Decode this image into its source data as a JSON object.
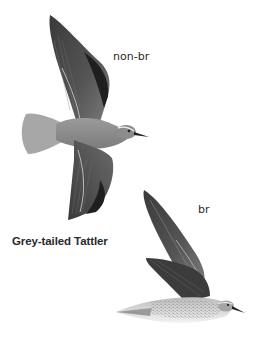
{
  "plate": {
    "species_name": "Grey-tailed Tattler",
    "figures": [
      {
        "id": "non-breeding",
        "label": "non-br",
        "pose": "flight, dorsal view, wings spread"
      },
      {
        "id": "breeding",
        "label": "br",
        "pose": "flight, side view, wings raised"
      }
    ]
  },
  "colors": {
    "background": "#ffffff",
    "text": "#2a2a2a",
    "wing_dark": "#2b2b2b",
    "wing_mid": "#5a5a5a",
    "body_grey": "#8a8a8a",
    "underparts_light": "#e6e6e6"
  }
}
